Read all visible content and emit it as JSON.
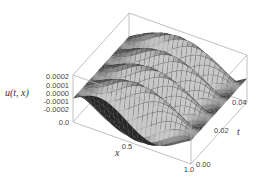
{
  "chart_data": {
    "type": "surface3d",
    "title": "",
    "zlabel": "u(t, x)",
    "xlabel": "x",
    "ylabel": "t",
    "x_range": [
      0.0,
      1.0
    ],
    "t_range": [
      0.0,
      0.05
    ],
    "z_range": [
      -0.0002,
      0.0002
    ],
    "x_ticks": [
      "0.0",
      "0.5",
      "1.0"
    ],
    "t_ticks": [
      "0.00",
      "0.02",
      "0.04"
    ],
    "z_ticks": [
      "0.0002",
      "0.0001",
      "0.0000",
      "-0.0001",
      "-0.0002"
    ],
    "surface": {
      "description": "u(t,x) = A*sin(pi*x)*cos(omega*t), traveling standing wave oscillating in t",
      "amplitude": 0.0002,
      "x_periods": 0.5,
      "t_oscillations": 4,
      "grid_x": 24,
      "grid_t": 48
    },
    "colors": {
      "surface_base": "#8a8a8a",
      "mesh": "#3a3a3a",
      "box": "#b0b0b0"
    }
  }
}
